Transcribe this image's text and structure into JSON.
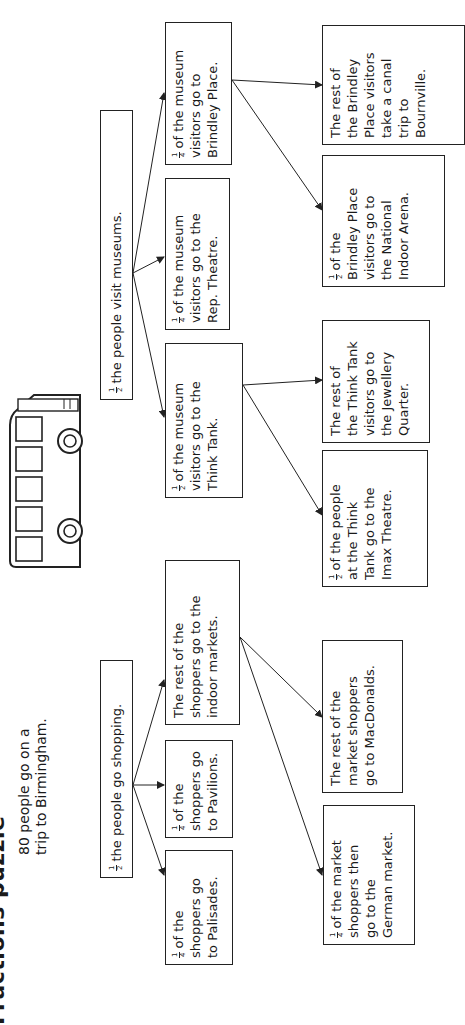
{
  "title": "Fractions puzzle",
  "intro": {
    "line1": "80 people go on a",
    "line2": "trip to Birmingham."
  },
  "shopping": {
    "root": {
      "frac_num": "1",
      "frac_den": "2",
      "text": "the people go shopping."
    },
    "palisades": {
      "frac_num": "1",
      "frac_den": "4",
      "lines": [
        "of the",
        "shoppers go",
        "to Palisades."
      ]
    },
    "pavilions": {
      "frac_num": "1",
      "frac_den": "4",
      "lines": [
        "of the",
        "shoppers go",
        "to Pavilions."
      ]
    },
    "indoor_markets": {
      "lines": [
        "The rest of the",
        "shoppers go to the",
        "indoor markets."
      ]
    },
    "german_market": {
      "frac_num": "1",
      "frac_den": "4",
      "lines": [
        "of the market",
        "shoppers then",
        "go to the",
        "German market."
      ]
    },
    "macdonalds": {
      "lines": [
        "The rest of the",
        "market shoppers",
        "go to MacDonalds."
      ]
    }
  },
  "museums": {
    "root": {
      "frac_num": "1",
      "frac_den": "2",
      "text": "the people visit museums."
    },
    "think_tank": {
      "frac_num": "1",
      "frac_den": "2",
      "lines": [
        "of the museum",
        "visitors go to the",
        "Think Tank."
      ]
    },
    "rep_theatre": {
      "frac_num": "1",
      "frac_den": "4",
      "lines": [
        "of the museum",
        "visitors go to the",
        "Rep. Theatre."
      ]
    },
    "brindley_place": {
      "frac_num": "1",
      "frac_den": "4",
      "lines": [
        "of the museum",
        "visitors go to",
        "Brindley Place."
      ]
    },
    "imax": {
      "frac_num": "1",
      "frac_den": "2",
      "lines": [
        "of the people",
        "at the Think",
        "Tank go to the",
        "Imax Theatre."
      ]
    },
    "jewellery_quarter": {
      "lines": [
        "The rest of",
        "the Think Tank",
        "visitors go to",
        "the Jewellery",
        "Quarter."
      ]
    },
    "nia": {
      "frac_num": "1",
      "frac_den": "2",
      "lines": [
        "of the",
        "Brindley Place",
        "visitors go to",
        "the National",
        "Indoor Arena."
      ]
    },
    "bournville": {
      "lines": [
        "The rest of",
        "the Brindley",
        "Place visitors",
        "take a canal",
        "trip to",
        "Bournville."
      ]
    }
  },
  "illustration": {
    "icon": "bus-icon"
  }
}
